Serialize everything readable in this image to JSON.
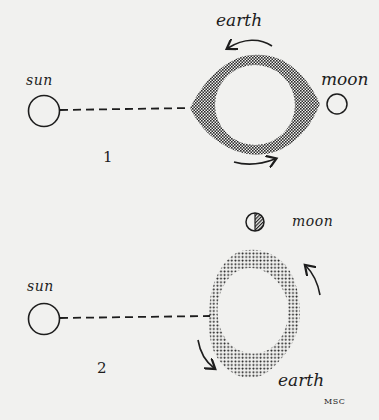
{
  "diagram": {
    "colors": {
      "background": "#f1f1ef",
      "ink": "#1d1d1d",
      "stipple": "#2a2a2a"
    },
    "panels": [
      {
        "number": "1",
        "labels": {
          "sun": "sun",
          "moon": "moon",
          "earth": "earth"
        },
        "description": "Sun, Earth and Moon aligned; tidal bulges point toward sun and moon; arrows show Earth rotating counter-clockwise"
      },
      {
        "number": "2",
        "labels": {
          "sun": "sun",
          "moon": "moon",
          "earth": "earth"
        },
        "description": "Moon at right angle to sun (half moon); tidal bulge oriented toward moon; arrows show Earth rotating counter-clockwise"
      }
    ],
    "signature": "MSC"
  }
}
